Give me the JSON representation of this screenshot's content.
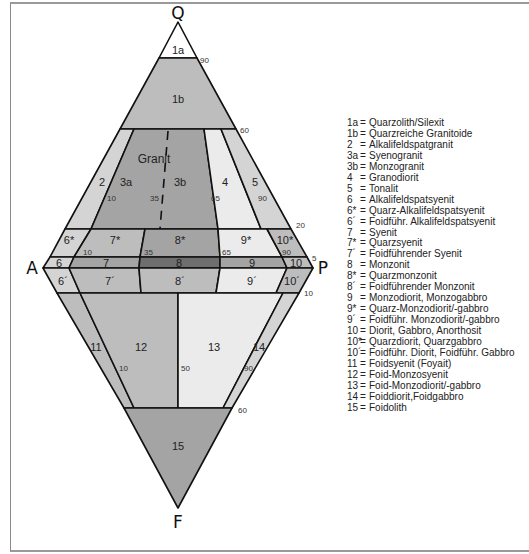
{
  "diagram": {
    "vertices": {
      "Q": "Q",
      "A": "A",
      "P": "P",
      "F": "F"
    },
    "colors": {
      "white": "#ffffff",
      "light": "#ebebeb",
      "lightgray": "#d4d4d4",
      "mid": "#bdbdbd",
      "dark": "#a4a4a4",
      "darker": "#8e8e8e",
      "darkest": "#6e6e6e",
      "stroke": "#111111"
    },
    "regions": [
      {
        "id": "1a",
        "label": "1a"
      },
      {
        "id": "1b",
        "label": "1b"
      },
      {
        "id": "2",
        "label": "2"
      },
      {
        "id": "3a",
        "label": "3a"
      },
      {
        "id": "3b",
        "label": "3b"
      },
      {
        "id": "granit",
        "label": "Granit"
      },
      {
        "id": "4",
        "label": "4"
      },
      {
        "id": "5",
        "label": "5"
      },
      {
        "id": "6*",
        "label": "6*"
      },
      {
        "id": "7*",
        "label": "7*"
      },
      {
        "id": "8*",
        "label": "8*"
      },
      {
        "id": "9*",
        "label": "9*"
      },
      {
        "id": "10*",
        "label": "10*"
      },
      {
        "id": "6",
        "label": "6"
      },
      {
        "id": "7",
        "label": "7"
      },
      {
        "id": "8",
        "label": "8"
      },
      {
        "id": "9",
        "label": "9"
      },
      {
        "id": "10",
        "label": "10"
      },
      {
        "id": "6'",
        "label": "6´"
      },
      {
        "id": "7'",
        "label": "7´"
      },
      {
        "id": "8'",
        "label": "8´"
      },
      {
        "id": "9'",
        "label": "9´"
      },
      {
        "id": "10'",
        "label": "10´"
      },
      {
        "id": "11",
        "label": "11"
      },
      {
        "id": "12",
        "label": "12"
      },
      {
        "id": "13",
        "label": "13"
      },
      {
        "id": "14",
        "label": "14"
      },
      {
        "id": "15",
        "label": "15"
      }
    ],
    "ticks": {
      "q90": "90",
      "q60": "60",
      "q20": "20",
      "q5": "5",
      "f10": "10",
      "f60": "60",
      "p10a": "10",
      "p35a": "35",
      "p65a": "65",
      "p90a": "90",
      "p10b": "10",
      "p35b": "35",
      "p65b": "65",
      "p90b": "90",
      "p10c": "10",
      "p50c": "50",
      "p90c": "90"
    }
  },
  "legend": [
    {
      "code": "1a",
      "text": "Quarzolith/Silexit"
    },
    {
      "code": "1b",
      "text": "Quarzreiche Granitoide"
    },
    {
      "code": "2",
      "text": "Alkalifeldspatgranit"
    },
    {
      "code": "3a",
      "text": "Syenogranit"
    },
    {
      "code": "3b",
      "text": "Monzogranit"
    },
    {
      "code": "4",
      "text": "Granodiorit"
    },
    {
      "code": "5",
      "text": "Tonalit"
    },
    {
      "code": "6",
      "text": "Alkalifeldspatsyenit"
    },
    {
      "code": "6*",
      "text": "Quarz-Alkalifeldspatsyenit"
    },
    {
      "code": "6´",
      "text": "Foidführ. Alkalifeldspatsyenit"
    },
    {
      "code": "7",
      "text": "Syenit"
    },
    {
      "code": "7*",
      "text": "Quarzsyenit"
    },
    {
      "code": "7´",
      "text": "Foidführender Syenit"
    },
    {
      "code": "8",
      "text": "Monzonit"
    },
    {
      "code": "8*",
      "text": "Quarzmonzonit"
    },
    {
      "code": "8´",
      "text": "Foidführender Monzonit"
    },
    {
      "code": "9",
      "text": "Monzodiorit, Monzogabbro"
    },
    {
      "code": "9*",
      "text": "Quarz-Monzodiorit/-gabbro"
    },
    {
      "code": "9´",
      "text": "Foidführ. Monzodiorit/-gabbro"
    },
    {
      "code": "10",
      "text": "Diorit, Gabbro, Anorthosit"
    },
    {
      "code": "10*",
      "text": "Quarzdiorit, Quarzgabbro"
    },
    {
      "code": "10´",
      "text": "Foidführ. Diorit, Foidführ. Gabbro"
    },
    {
      "code": "11",
      "text": "Foidsyenit (Foyait)"
    },
    {
      "code": "12",
      "text": "Foid-Monzosyenit"
    },
    {
      "code": "13",
      "text": "Foid-Monzodiorit/-gabbro"
    },
    {
      "code": "14",
      "text": "Foiddiorit,Foidgabbro"
    },
    {
      "code": "15",
      "text": "Foidolith"
    }
  ]
}
